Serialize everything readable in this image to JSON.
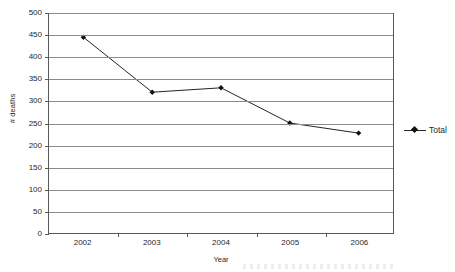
{
  "chart_data": {
    "type": "line",
    "title": "",
    "xlabel": "Year",
    "ylabel": "# deaths",
    "categories": [
      "2002",
      "2003",
      "2004",
      "2005",
      "2006"
    ],
    "series": [
      {
        "name": "Total",
        "values": [
          445,
          320,
          330,
          250,
          227
        ],
        "marker": "diamond",
        "color": "#222222"
      }
    ],
    "ylim": [
      0,
      500
    ],
    "ytick_values": [
      500,
      450,
      400,
      350,
      300,
      250,
      200,
      150,
      100,
      50,
      0
    ],
    "ytick_labels": [
      "500",
      "450",
      "400",
      "350",
      "300",
      "250",
      "200",
      "150",
      "100",
      "50",
      "0"
    ],
    "grid": "horizontal",
    "legend_position": "right",
    "legend_entries": [
      "Total"
    ]
  },
  "legend": {
    "entry_label": "Total",
    "marker_icon": "diamond-marker-icon",
    "line_icon": "legend-line-icon"
  },
  "axes": {
    "x_title": "Year",
    "y_title": "# deaths"
  },
  "colors": {
    "axis": "#595959",
    "gridline": "#8c8c8c",
    "series": "#222222",
    "text": "#1f1f1f",
    "background": "#ffffff"
  }
}
